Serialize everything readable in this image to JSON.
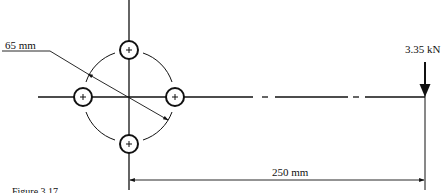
{
  "diagram": {
    "type": "bolted-bracket-eccentric-load",
    "labels": {
      "pitch_circle_diameter": "65 mm",
      "load": "3.35 kN",
      "eccentricity": "250 mm",
      "caption": "Figure 3.17"
    },
    "geometry": {
      "bolt_group_center": [
        129,
        97
      ],
      "pitch_circle_radius_px": 46,
      "bolt_hole_radius_px": 9,
      "bolt_positions": [
        {
          "name": "top",
          "x": 129,
          "y": 50
        },
        {
          "name": "left",
          "x": 83,
          "y": 97
        },
        {
          "name": "right",
          "x": 175,
          "y": 97
        },
        {
          "name": "bottom",
          "x": 129,
          "y": 144
        }
      ],
      "load_line_x": 425,
      "dimension_line_y": 180
    },
    "colors": {
      "line": "#111111",
      "background": "#ffffff"
    }
  }
}
